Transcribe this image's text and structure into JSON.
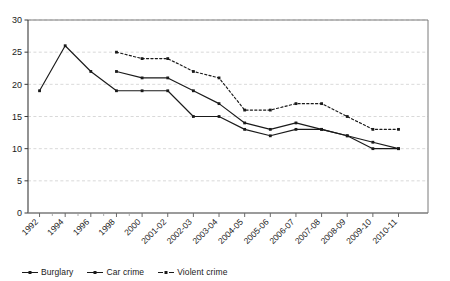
{
  "chart_data": {
    "type": "line",
    "title": "",
    "subtitle": "",
    "xlabel": "",
    "ylabel": "",
    "ylim": [
      0,
      30
    ],
    "yticks": [
      0,
      5,
      10,
      15,
      20,
      25,
      30
    ],
    "grid": true,
    "legend_position": "bottom-left",
    "categories": [
      "1992",
      "1993",
      "1994",
      "1995",
      "1996",
      "1997",
      "1998",
      "1999",
      "2000",
      "2001-02",
      "2002-03",
      "2003-04",
      "2004-05",
      "2005-06",
      "2006-07",
      "2007-08",
      "2008-09",
      "2009-10",
      "2010-11"
    ],
    "tick_labels": [
      "1992",
      "1994",
      "1996",
      "1998",
      "2000",
      "2001-02",
      "2002-03",
      "2003-04",
      "2004-05",
      "2005-06",
      "2006-07",
      "2007-08",
      "2008-09",
      "2009-10",
      "2010-11"
    ],
    "series": [
      {
        "name": "Burglary",
        "style": "solid",
        "color": "#1a1a1a",
        "x": [
          "1992",
          "1994",
          "1996",
          "1998",
          "2000",
          "2001-02",
          "2002-03",
          "2003-04",
          "2004-05",
          "2005-06",
          "2006-07",
          "2007-08",
          "2008-09",
          "2009-10",
          "2010-11"
        ],
        "values": [
          19,
          26,
          22,
          19,
          19,
          19,
          15,
          15,
          13,
          12,
          13,
          13,
          12,
          10,
          10
        ]
      },
      {
        "name": "Car crime",
        "style": "solid",
        "color": "#1a1a1a",
        "x": [
          "1998",
          "2000",
          "2001-02",
          "2002-03",
          "2003-04",
          "2004-05",
          "2005-06",
          "2006-07",
          "2007-08",
          "2008-09",
          "2009-10",
          "2010-11"
        ],
        "values": [
          22,
          21,
          21,
          19,
          17,
          14,
          13,
          14,
          13,
          12,
          11,
          10
        ]
      },
      {
        "name": "Violent crime",
        "style": "dashed",
        "color": "#1a1a1a",
        "x": [
          "1998",
          "2000",
          "2001-02",
          "2002-03",
          "2003-04",
          "2004-05",
          "2005-06",
          "2006-07",
          "2007-08",
          "2008-09",
          "2009-10",
          "2010-11"
        ],
        "values": [
          25,
          24,
          24,
          22,
          21,
          16,
          16,
          17,
          17,
          15,
          13,
          13
        ]
      }
    ]
  },
  "legend": {
    "items": [
      {
        "label": "Burglary",
        "style": "solid"
      },
      {
        "label": "Car crime",
        "style": "solid"
      },
      {
        "label": "Violent crime",
        "style": "dashed"
      }
    ]
  },
  "axis": {
    "y_tick_labels": [
      "0",
      "5",
      "10",
      "15",
      "20",
      "25",
      "30"
    ],
    "x_tick_labels": [
      "1992",
      "1994",
      "1996",
      "1998",
      "2000",
      "2001-02",
      "2002-03",
      "2003-04",
      "2004-05",
      "2005-06",
      "2006-07",
      "2007-08",
      "2008-09",
      "2009-10",
      "2010-11"
    ]
  },
  "colors": {
    "line": "#1a1a1a",
    "grid": "#cfcfcf",
    "axis": "#4d4d4d",
    "text": "#1a1a1a",
    "background": "#ffffff"
  }
}
